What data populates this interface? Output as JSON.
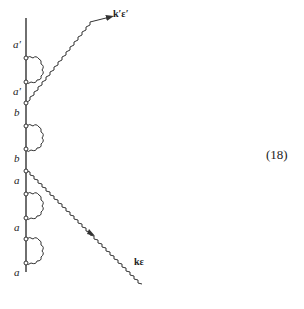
{
  "diagram": {
    "equation_number": "(18)",
    "photon_out_label": "k′ε′",
    "photon_in_label": "kε",
    "state_labels": [
      "a′",
      "a′",
      "b",
      "b",
      "a",
      "a",
      "a"
    ],
    "colors": {
      "line": "#333333",
      "background": "#ffffff"
    }
  }
}
